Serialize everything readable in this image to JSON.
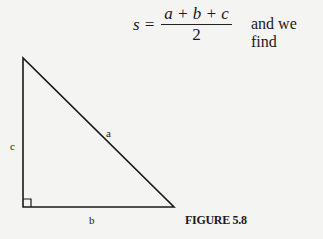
{
  "formula": {
    "lhs": "s =",
    "numerator": "a + b + c",
    "denominator": "2",
    "trailing_text": "and we find"
  },
  "triangle": {
    "labels": {
      "hypotenuse": "a",
      "base": "b",
      "height": "c"
    },
    "vertices": [
      [
        23,
        58
      ],
      [
        23,
        207
      ],
      [
        174,
        207
      ]
    ],
    "right_angle_marker": true
  },
  "caption": "FIGURE 5.8"
}
